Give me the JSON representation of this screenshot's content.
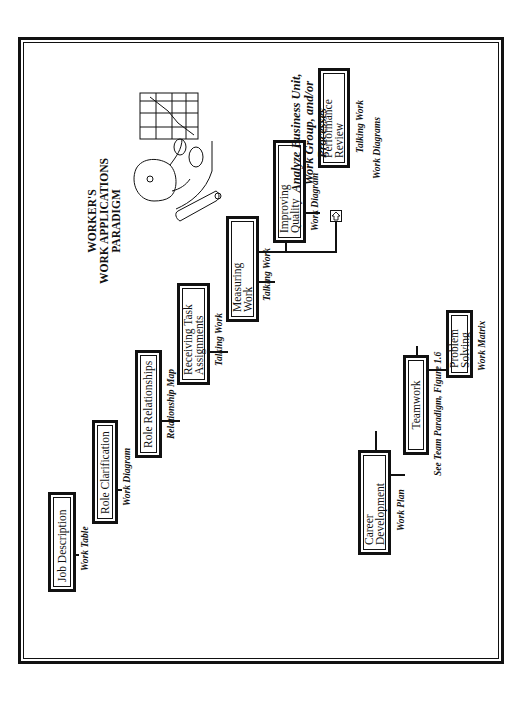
{
  "title": "WORKER'S\nWORK APPLICATIONS\nPARADIGM",
  "orientation": "rotated 90 degrees counter-clockwise",
  "main_path": [
    {
      "id": "job-description",
      "label": "Job Description",
      "tool": "Work Table"
    },
    {
      "id": "role-clarification",
      "label": "Role Clarification",
      "tool": "Work Diagram"
    },
    {
      "id": "role-relationships",
      "label": "Role Relationships",
      "tool": "Relationship Map"
    },
    {
      "id": "receiving-task-assignments",
      "label": "Receiving Task\nAssignments",
      "tool": "Talking Work"
    },
    {
      "id": "measuring-work",
      "label": "Measuring\nWork",
      "tool": "Talking Work"
    },
    {
      "id": "improving-quality",
      "label": "Improving\nQuality",
      "tool": "Work Diagram"
    },
    {
      "id": "performance-review",
      "label": "Performance\nReview",
      "tool": "Talking Work"
    }
  ],
  "branch": {
    "icon": "arrow-right-icon",
    "label": "Analyze Business Unit,\nWork Group, and/or\nProcesses",
    "tool": "Work Diagrams"
  },
  "secondary_path": [
    {
      "id": "career-development",
      "label": "Career\nDevelopment",
      "tool": "Work Plan"
    },
    {
      "id": "teamwork",
      "label": "Teamwork",
      "tool": "See Team Paradigm, Figure 1.6"
    },
    {
      "id": "problem-solving",
      "label": "Problem Solving",
      "tool": "Work Matrix"
    }
  ],
  "clipart": "worker-with-chart-illustration",
  "colors": {
    "ink": "#111111",
    "background": "#ffffff"
  }
}
